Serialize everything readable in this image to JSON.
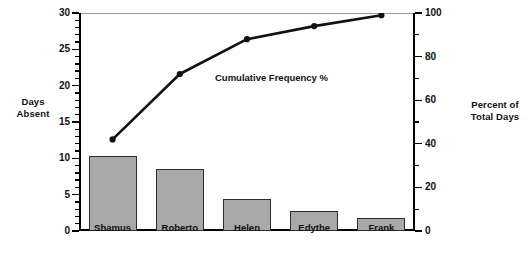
{
  "chart_data": {
    "type": "bar",
    "title": "",
    "categories": [
      "Shamus",
      "Roberto",
      "Helen",
      "Edythe",
      "Frank"
    ],
    "values": [
      10.3,
      8.6,
      4.4,
      2.7,
      1.8
    ],
    "xlabel": "",
    "ylabel": "Days Absent",
    "ylim": [
      0,
      30
    ],
    "yticks": [
      0,
      5,
      10,
      15,
      20,
      25,
      30
    ],
    "yticklabels": [
      "0",
      "5",
      "10",
      "15",
      "20",
      "25",
      "30"
    ],
    "y_minor_step": 1,
    "grid": false,
    "legend": "none",
    "series": [
      {
        "name": "Cumulative Frequency %",
        "type": "line",
        "axis": "right",
        "values": [
          42,
          72,
          88,
          94,
          99
        ],
        "marker": "dot"
      }
    ],
    "secondary_axis": {
      "label": "Percent of Total Days",
      "lim": [
        0,
        100
      ],
      "ticks": [
        0,
        20,
        40,
        60,
        80,
        100
      ],
      "ticklabels": [
        "0",
        "20",
        "40",
        "60",
        "80",
        "100"
      ],
      "minor_step": 10
    },
    "annotations": [
      {
        "text": "Cumulative Frequency %"
      }
    ],
    "colors": {
      "bar_fill": "#a8a8a8",
      "bar_edge": "#2d2d2d",
      "line": "#111111",
      "axis": "#000000",
      "background": "#ffffff"
    }
  },
  "left_axis_title": "Days\nAbsent",
  "left_axis_title_line1": "Days",
  "left_axis_title_line2": "Absent",
  "right_axis_title_line1": "Percent of",
  "right_axis_title_line2": "Total Days"
}
